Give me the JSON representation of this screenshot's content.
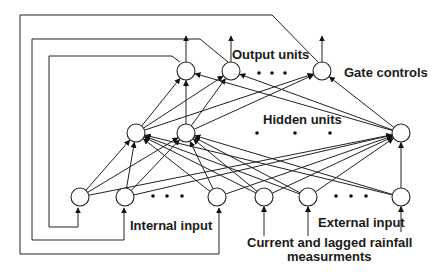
{
  "diagram": {
    "colors": {
      "line": "#222222",
      "text": "#1a1a1a",
      "background": "#ffffff"
    },
    "labels": {
      "output_units": "Output units",
      "gate_controls": "Gate controls",
      "hidden_units": "Hidden units",
      "internal_input": "Internal input",
      "external_input": "External input",
      "rainfall_line1": "Current and lagged rainfall",
      "rainfall_line2": "measurments"
    },
    "layers": {
      "output": {
        "nodes": [
          {
            "id": "o1",
            "x": 186,
            "y": 71
          },
          {
            "id": "o2",
            "x": 231,
            "y": 71
          },
          {
            "id": "o3",
            "x": 322,
            "y": 71
          }
        ],
        "ellipsis": [
          {
            "x": 259,
            "y": 73
          },
          {
            "x": 272,
            "y": 73
          },
          {
            "x": 285,
            "y": 73
          }
        ]
      },
      "hidden": {
        "nodes": [
          {
            "id": "h1",
            "x": 136,
            "y": 133
          },
          {
            "id": "h2",
            "x": 186,
            "y": 133
          },
          {
            "id": "h3",
            "x": 401,
            "y": 133
          }
        ],
        "ellipsis": [
          {
            "x": 257,
            "y": 133
          },
          {
            "x": 295,
            "y": 133
          },
          {
            "x": 330,
            "y": 133
          }
        ]
      },
      "internal_input": {
        "nodes": [
          {
            "id": "i1",
            "x": 80,
            "y": 197
          },
          {
            "id": "i2",
            "x": 125,
            "y": 197
          },
          {
            "id": "i3",
            "x": 217,
            "y": 197
          }
        ],
        "ellipsis": [
          {
            "x": 153,
            "y": 196
          },
          {
            "x": 167,
            "y": 196
          },
          {
            "x": 182,
            "y": 196
          }
        ]
      },
      "external_input": {
        "nodes": [
          {
            "id": "e1",
            "x": 264,
            "y": 197
          },
          {
            "id": "e2",
            "x": 308,
            "y": 197
          },
          {
            "id": "e3",
            "x": 401,
            "y": 197
          }
        ],
        "ellipsis": [
          {
            "x": 336,
            "y": 196
          },
          {
            "x": 351,
            "y": 196
          },
          {
            "x": 366,
            "y": 196
          }
        ]
      }
    },
    "node_radius": 9,
    "connections": "fully-connected input->hidden and hidden->output",
    "feedback_loops": [
      {
        "from": "o1",
        "to": "i1",
        "path": "180,62 172,56 49,56 49,227 78,227 78,208"
      },
      {
        "from": "o2",
        "to": "i2",
        "path": "228,62 200,39 32,39 32,240 124,240 124,208"
      },
      {
        "from": "o3",
        "to": "i3",
        "path": "318,62 272,15 20,15 20,254 219,254 219,208"
      }
    ]
  }
}
